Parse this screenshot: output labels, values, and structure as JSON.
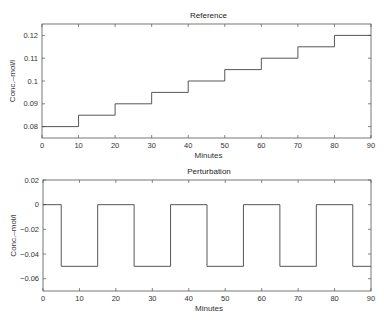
{
  "chart_data": [
    {
      "type": "line",
      "title": "Reference",
      "xlabel": "Minutes",
      "ylabel": "Conc.–mol/l",
      "xlim": [
        0,
        90
      ],
      "ylim": [
        0.075,
        0.125
      ],
      "xticks": [
        0,
        10,
        20,
        30,
        40,
        50,
        60,
        70,
        80,
        90
      ],
      "yticks": [
        0.08,
        0.09,
        0.1,
        0.11,
        0.12
      ],
      "ytick_labels": [
        "0.08",
        "0.09",
        "0.1",
        "0.11",
        "0.12"
      ],
      "grid": false,
      "step": true,
      "x": [
        0,
        10,
        10,
        20,
        20,
        30,
        30,
        40,
        40,
        50,
        50,
        60,
        60,
        70,
        70,
        80,
        80,
        90
      ],
      "y": [
        0.08,
        0.08,
        0.085,
        0.085,
        0.09,
        0.09,
        0.095,
        0.095,
        0.1,
        0.1,
        0.105,
        0.105,
        0.11,
        0.11,
        0.115,
        0.115,
        0.12,
        0.12
      ]
    },
    {
      "type": "line",
      "title": "Perturbation",
      "xlabel": "Minutes",
      "ylabel": "Conc.–mol/l",
      "xlim": [
        0,
        90
      ],
      "ylim": [
        -0.07,
        0.02
      ],
      "xticks": [
        0,
        10,
        20,
        30,
        40,
        50,
        60,
        70,
        80,
        90
      ],
      "yticks": [
        0.02,
        0,
        -0.02,
        -0.04,
        -0.06
      ],
      "ytick_labels": [
        "0.02",
        "0",
        "−0.02",
        "−0.04",
        "−0.06"
      ],
      "grid": false,
      "step": true,
      "x": [
        0,
        5,
        5,
        15,
        15,
        25,
        25,
        35,
        35,
        45,
        45,
        55,
        55,
        65,
        65,
        75,
        75,
        85,
        85,
        90
      ],
      "y": [
        0,
        0,
        -0.05,
        -0.05,
        0,
        0,
        -0.05,
        -0.05,
        0,
        0,
        -0.05,
        -0.05,
        0,
        0,
        -0.05,
        -0.05,
        0,
        0,
        -0.05,
        -0.05
      ]
    }
  ]
}
